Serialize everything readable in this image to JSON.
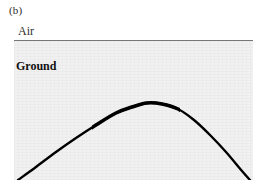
{
  "figure": {
    "panel_label": "(b)",
    "air_label": "Air",
    "ground_label": "Ground",
    "background_color": "#ffffff",
    "ground_fill_color": "#f1f1f1",
    "boundary_line_color": "#777777",
    "curve_color": "#000000"
  },
  "chart_data": {
    "type": "line",
    "title": "(b)",
    "xlabel": "",
    "ylabel": "",
    "grid": false,
    "legend_position": "none",
    "annotations": [
      {
        "text": "(b)",
        "x": 9,
        "y": 3,
        "role": "panel-label"
      },
      {
        "text": "Air",
        "x": 18,
        "y": 24,
        "role": "region-label-above-surface"
      },
      {
        "text": "Ground",
        "x": 16,
        "y": 59,
        "role": "region-label-below-surface"
      }
    ],
    "axis_ranges": {
      "xlim": [
        0,
        239
      ],
      "ylim": [
        0,
        139
      ]
    },
    "series": [
      {
        "name": "ground-surface-boundary",
        "style": "straight-horizontal-line",
        "color": "#777777",
        "line_width": 1.2,
        "x": [
          0,
          239
        ],
        "y": [
          0,
          0
        ]
      },
      {
        "name": "buried-interface-arc",
        "style": "thick-parabolic-arc",
        "color": "#000000",
        "line_width": 3,
        "x": [
          4,
          22,
          42,
          62,
          82,
          102,
          118,
          133,
          148,
          164,
          180,
          196,
          212,
          228,
          236
        ],
        "y": [
          139,
          126,
          111,
          97,
          84,
          72,
          66,
          62,
          63,
          68,
          79,
          94,
          111,
          130,
          139
        ]
      }
    ]
  }
}
